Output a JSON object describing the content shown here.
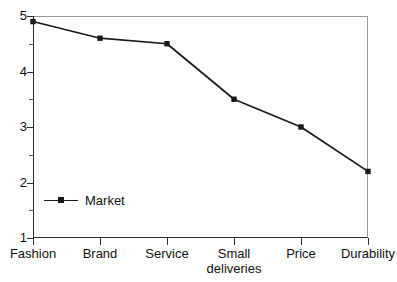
{
  "chart_data": {
    "type": "line",
    "title": "",
    "xlabel": "",
    "ylabel": "",
    "categories": [
      "Fashion",
      "Brand",
      "Service",
      "Small\ndeliveries",
      "Price",
      "Durability"
    ],
    "series": [
      {
        "name": "Market",
        "values": [
          4.9,
          4.6,
          4.5,
          3.5,
          3.0,
          2.2
        ]
      }
    ],
    "ylim": [
      1,
      5
    ],
    "y_ticks": [
      5,
      4,
      3,
      2,
      1
    ],
    "y_tick_labels": [
      "5",
      "4",
      "3",
      "2",
      "1"
    ],
    "y_minor_ticks": [
      4.5,
      3.5,
      2.5,
      1.5
    ],
    "grid": false,
    "legend_position": "inside-bottom-left",
    "marker": "square",
    "colors": {
      "line": "#1a1a1a",
      "marker": "#1a1a1a",
      "axis": "#2b2b2b",
      "frame": "#9a9a9a",
      "background": "#ffffff",
      "text": "#111111"
    }
  },
  "legend": {
    "entries": [
      {
        "label": "Market"
      }
    ]
  }
}
